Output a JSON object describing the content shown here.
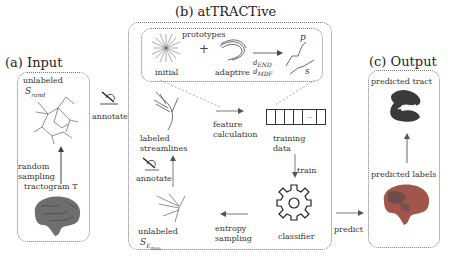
{
  "panels": {
    "input": {
      "title": "(a) Input",
      "unlabeled_label": "unlabeled",
      "unlabeled_symbol": "S",
      "unlabeled_sub": "rand",
      "sampling_label_1": "random",
      "sampling_label_2": "sampling",
      "tractogram_label": "tractogram T"
    },
    "attractive": {
      "title": "(b) atTRACTive",
      "prototypes": {
        "title": "prototypes",
        "initial": "initial",
        "plus": "+",
        "adaptive": "adaptive",
        "d_end": "d",
        "d_end_sub": "END",
        "d_mdf": "d",
        "d_mdf_sub": "MDF",
        "p_label": "p",
        "s_label": "s"
      },
      "labeled_1": "labeled",
      "labeled_2": "streamlines",
      "feature_1": "feature",
      "feature_2": "calculation",
      "training_1": "training",
      "training_2": "data",
      "training_cell_dots": "...",
      "train": "train",
      "annotate_inner": "annotate",
      "unlabeled_label": "unlabeled",
      "unlabeled_symbol": "S",
      "unlabeled_sub": "E",
      "unlabeled_subsub": "max",
      "entropy_1": "entropy",
      "entropy_2": "sampling",
      "classifier": "classifier"
    },
    "output": {
      "title": "(c) Output",
      "tract_label": "predicted tract",
      "labels_label": "predicted labels"
    }
  },
  "connectors": {
    "annotate": "annotate",
    "predict": "predict"
  },
  "colors": {
    "border": "#777777",
    "arrow": "#555555",
    "brain_gray": "#6e6e6e",
    "labels_red": "#a0564a",
    "tract_dark": "#3a3a3a"
  }
}
